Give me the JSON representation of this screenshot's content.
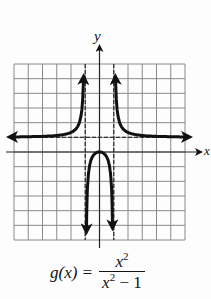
{
  "chart_data": {
    "type": "line",
    "title": "",
    "xlabel": "x",
    "ylabel": "y",
    "xlim": [
      -6,
      6
    ],
    "ylim": [
      -6,
      6
    ],
    "grid": true,
    "grid_step": 1,
    "function": "g(x) = x^2/(x^2 - 1)",
    "asymptotes": {
      "vertical": [
        -1,
        1
      ],
      "horizontal": [
        1
      ]
    },
    "series": [
      {
        "name": "left branch (x < -1)",
        "points": [
          [
            -6,
            1.03
          ],
          [
            -4,
            1.07
          ],
          [
            -3,
            1.13
          ],
          [
            -2,
            1.33
          ],
          [
            -1.5,
            1.8
          ],
          [
            -1.25,
            2.78
          ],
          [
            -1.15,
            4.1
          ],
          [
            -1.1,
            5.76
          ]
        ]
      },
      {
        "name": "middle branch (-1 < x < 1)",
        "points": [
          [
            -0.92,
            -5.5
          ],
          [
            -0.85,
            -2.6
          ],
          [
            -0.6,
            -0.56
          ],
          [
            -0.3,
            -0.1
          ],
          [
            0,
            0
          ],
          [
            0.3,
            -0.1
          ],
          [
            0.6,
            -0.56
          ],
          [
            0.85,
            -2.6
          ],
          [
            0.92,
            -5.5
          ]
        ]
      },
      {
        "name": "right branch (x > 1)",
        "points": [
          [
            1.1,
            5.76
          ],
          [
            1.15,
            4.1
          ],
          [
            1.25,
            2.78
          ],
          [
            1.5,
            1.8
          ],
          [
            2,
            1.33
          ],
          [
            3,
            1.13
          ],
          [
            4,
            1.07
          ],
          [
            6,
            1.03
          ]
        ]
      }
    ],
    "colors": {
      "curve": "#111111",
      "grid": "#8a8a8a",
      "asymptote": "#333333"
    }
  },
  "labels": {
    "y_axis": "y",
    "x_axis": "x",
    "formula_lhs": "g(x) =",
    "formula_num_base": "x",
    "formula_num_exp": "2",
    "formula_den_base": "x",
    "formula_den_exp": "2",
    "formula_den_tail": " − 1"
  }
}
